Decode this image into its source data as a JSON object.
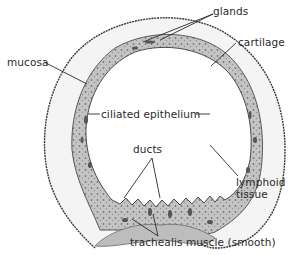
{
  "diagram": {
    "colors": {
      "ink": "#2a2a2a",
      "cartilage_fill": "#f4f4f4",
      "mucosa_fill": "#c9c9c9",
      "mucosa_dark": "#6e6e6e",
      "background": "#ffffff"
    },
    "labels": {
      "glands": "glands",
      "cartilage": "cartilage",
      "mucosa": "mucosa",
      "ciliated_epithelium": "ciliated epithelium",
      "ducts": "ducts",
      "lymphoid_line1": "lymphoid",
      "lymphoid_line2": "tissue",
      "trachealis": "trachealis muscle (smooth)"
    }
  }
}
